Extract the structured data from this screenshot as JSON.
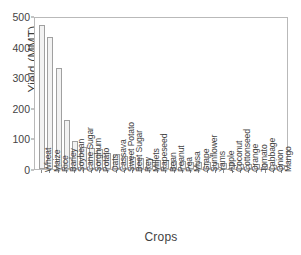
{
  "chart_data": {
    "type": "bar",
    "title": "",
    "xlabel": "Crops",
    "ylabel": "Yield (MMT)",
    "ylim": [
      0,
      500
    ],
    "yticks": [
      0,
      100,
      200,
      300,
      400,
      500
    ],
    "grid": false,
    "legend": null,
    "bar_facecolor": "#f2f2f2",
    "bar_edgecolor": "#a0a0a0",
    "axis_color": "#b9b9b9",
    "categories": [
      "Wheat",
      "Maize",
      "Rice",
      "Barley",
      "Soybean",
      "Cane Sugar",
      "Sorghum",
      "Potato",
      "Oats",
      "Cassava",
      "Sweet Potato",
      "Beet Sugar",
      "Rey",
      "Millets",
      "Rapeseed",
      "Bean",
      "Peanut",
      "Pea",
      "Musa",
      "Grape",
      "Sunflower",
      "Yams",
      "Apple",
      "Coconut",
      "Cottonseed",
      "Orange",
      "Tomato",
      "Cabbage",
      "Onion",
      "Mango"
    ],
    "values": [
      472,
      432,
      330,
      160,
      93,
      73,
      68,
      66,
      52,
      48,
      42,
      38,
      36,
      33,
      30,
      28,
      26,
      25,
      24,
      23,
      22,
      21,
      20,
      19,
      18,
      17,
      16,
      15,
      14,
      13
    ]
  }
}
